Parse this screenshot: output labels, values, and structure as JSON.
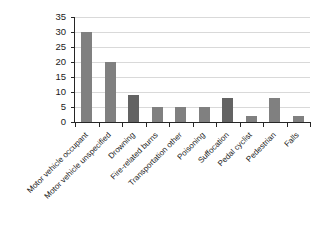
{
  "chart_data": {
    "type": "bar",
    "title": "",
    "xlabel": "",
    "ylabel": "",
    "ylim": [
      0,
      35
    ],
    "ytick_values": [
      0,
      5,
      10,
      15,
      20,
      25,
      30,
      35
    ],
    "ytick_labels": [
      "0",
      "5",
      "10",
      "15",
      "20",
      "25",
      "30",
      "35"
    ],
    "grid": true,
    "legend": "none",
    "bar_color": "#808080",
    "gridline_color": "#d9d9d9",
    "axis_color": "#262626",
    "categories": [
      "Motor vehicle occupant",
      "Motor vehicle unspecified",
      "Drowning",
      "Fire-related burns",
      "Transportation other",
      "Poisoning",
      "Suffocation",
      "Pedal cyclist",
      "Pedestrian",
      "Falls"
    ],
    "values": [
      30,
      20,
      9,
      5,
      5,
      5,
      8,
      2,
      8,
      2
    ]
  },
  "caption": {
    "text": ""
  }
}
